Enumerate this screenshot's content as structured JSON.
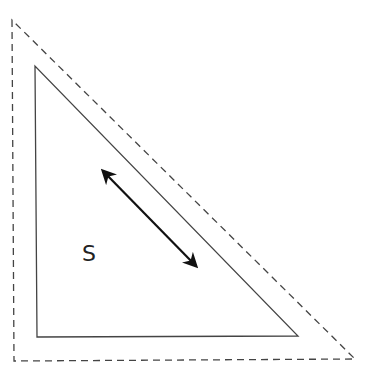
{
  "diagram": {
    "label": "S",
    "outer_triangle": {
      "style": "dashed",
      "points": [
        [
          12,
          20
        ],
        [
          14,
          361
        ],
        [
          355,
          359
        ]
      ]
    },
    "inner_triangle": {
      "style": "solid",
      "points": [
        [
          35,
          66
        ],
        [
          37,
          337
        ],
        [
          298,
          336
        ]
      ]
    },
    "arrow": {
      "type": "double-headed",
      "from": [
        101,
        169
      ],
      "to": [
        198,
        268
      ]
    },
    "colors": {
      "stroke": "#333333",
      "arrow": "#111111",
      "background": "#ffffff"
    }
  }
}
